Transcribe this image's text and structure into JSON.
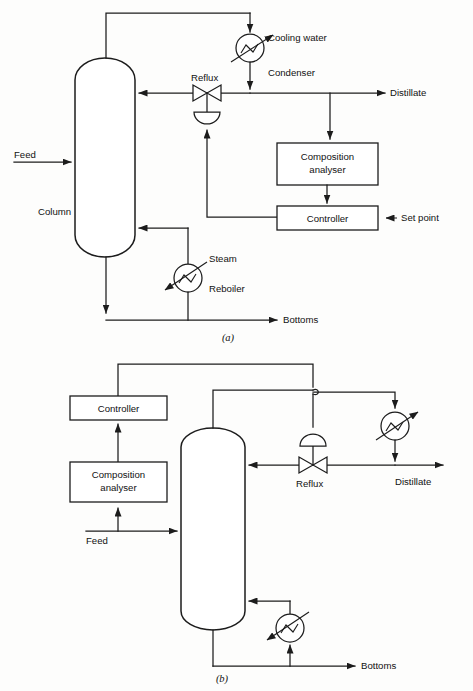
{
  "figure": {
    "panels": [
      {
        "id": "a",
        "caption": "(a)",
        "description": "Composition control of distillate by manipulating reflux flow",
        "labels": {
          "feed": "Feed",
          "column": "Column",
          "reflux": "Reflux",
          "cooling_water": "Cooling water",
          "condenser": "Condenser",
          "distillate": "Distillate",
          "composition_analyser_line1": "Composition",
          "composition_analyser_line2": "analyser",
          "controller": "Controller",
          "set_point": "Set point",
          "steam": "Steam",
          "reboiler": "Reboiler",
          "bottoms": "Bottoms"
        }
      },
      {
        "id": "b",
        "caption": "(b)",
        "description": "Feed-forward composition control using feed analysis",
        "labels": {
          "controller": "Controller",
          "composition_analyser_line1": "Composition",
          "composition_analyser_line2": "analyser",
          "feed": "Feed",
          "reflux": "Reflux",
          "distillate": "Distillate",
          "bottoms": "Bottoms"
        }
      }
    ],
    "colors": {
      "line": "#1c1c1c",
      "background": "#fdfdfc",
      "text": "#111111"
    },
    "icons": {
      "heat_exchanger": "circle-with-zigzag",
      "control_valve": "bowtie-valve",
      "valve_actuator": "semicircle-diaphragm",
      "vessel": "vertical-capsule-column",
      "line_crossing": "line-hop"
    }
  }
}
